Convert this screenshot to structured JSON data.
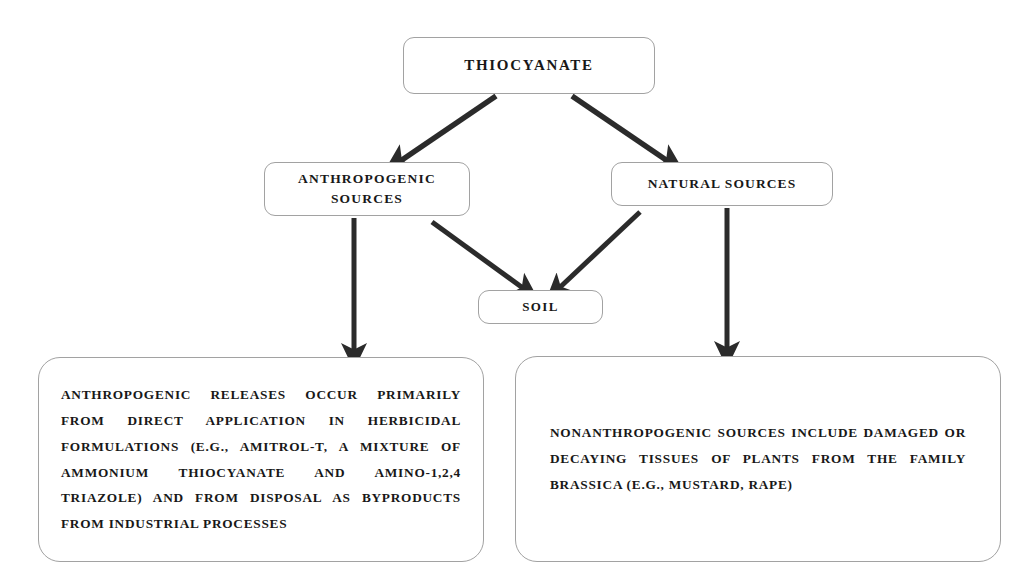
{
  "diagram": {
    "nodes": {
      "thiocyanate": {
        "label": "THIOCYANATE"
      },
      "anthropogenic_sources": {
        "label": "ANTHROPOGENIC\nSOURCES"
      },
      "natural_sources": {
        "label": "NATURAL SOURCES"
      },
      "soil": {
        "label": "SOIL"
      }
    },
    "text_boxes": {
      "anthropogenic_description": {
        "text": "ANTHROPOGENIC RELEASES OCCUR PRIMARILY FROM DIRECT APPLICATION IN HERBICIDAL FORMULATIONS (E.G., AMITROL-T, A MIXTURE OF AMMONIUM THIOCYANATE AND AMINO-1,2,4 TRIAZOLE) AND FROM DISPOSAL AS BYPRODUCTS FROM INDUSTRIAL PROCESSES"
      },
      "nonanthropogenic_description": {
        "text": "NONANTHROPOGENIC SOURCES INCLUDE DAMAGED OR DECAYING TISSUES OF PLANTS FROM THE FAMILY BRASSICA (E.G., MUSTARD, RAPE)"
      }
    },
    "edges": [
      {
        "name": "thiocyanate-to-anthropogenic",
        "from": "thiocyanate",
        "to": "anthropogenic_sources"
      },
      {
        "name": "thiocyanate-to-natural",
        "from": "thiocyanate",
        "to": "natural_sources"
      },
      {
        "name": "anthropogenic-to-soil",
        "from": "anthropogenic_sources",
        "to": "soil"
      },
      {
        "name": "natural-to-soil",
        "from": "natural_sources",
        "to": "soil"
      },
      {
        "name": "anthropogenic-to-description",
        "from": "anthropogenic_sources",
        "to": "anthropogenic_description"
      },
      {
        "name": "natural-to-description",
        "from": "natural_sources",
        "to": "nonanthropogenic_description"
      }
    ],
    "colors": {
      "background": "#ffffff",
      "box_border": "#a2a2a2",
      "text": "#181818",
      "arrow": "#2b2b2b"
    }
  }
}
